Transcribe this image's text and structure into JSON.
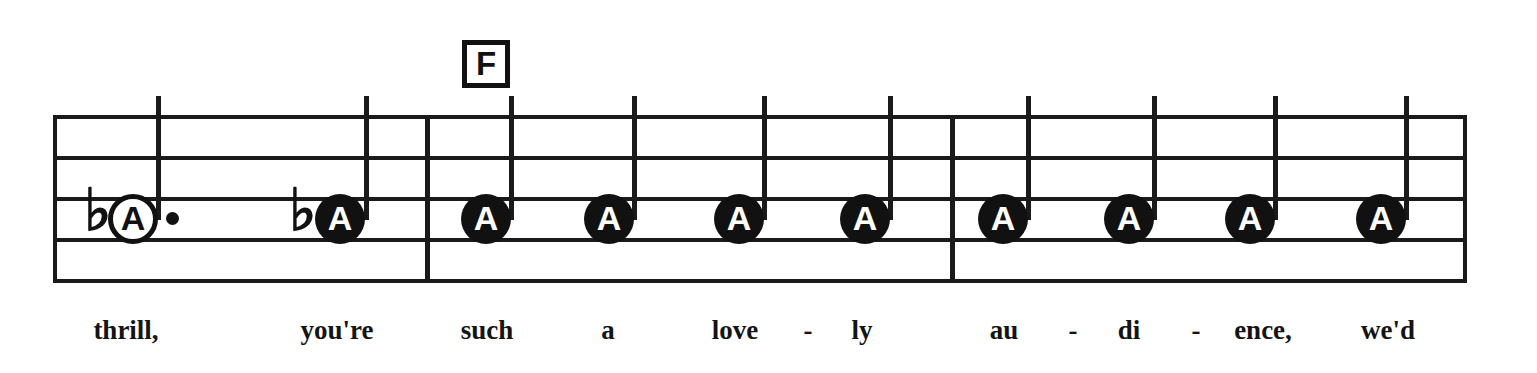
{
  "sheet": {
    "chord_symbol": "F",
    "chord_symbol_icon": "chord-box-icon",
    "staff_line_count": 5,
    "measure_count": 3,
    "colors": {
      "ink": "#111111",
      "paper": "#ffffff"
    },
    "notes": [
      {
        "letter": "A",
        "head": "hollow",
        "accidental": "♭",
        "dotted": true,
        "stem": "up",
        "measure": 1
      },
      {
        "letter": "A",
        "head": "filled",
        "accidental": "♭",
        "dotted": false,
        "stem": "up",
        "measure": 1
      },
      {
        "letter": "A",
        "head": "filled",
        "accidental": "",
        "dotted": false,
        "stem": "up",
        "measure": 2
      },
      {
        "letter": "A",
        "head": "filled",
        "accidental": "",
        "dotted": false,
        "stem": "up",
        "measure": 2
      },
      {
        "letter": "A",
        "head": "filled",
        "accidental": "",
        "dotted": false,
        "stem": "up",
        "measure": 2
      },
      {
        "letter": "A",
        "head": "filled",
        "accidental": "",
        "dotted": false,
        "stem": "up",
        "measure": 2
      },
      {
        "letter": "A",
        "head": "filled",
        "accidental": "",
        "dotted": false,
        "stem": "up",
        "measure": 3
      },
      {
        "letter": "A",
        "head": "filled",
        "accidental": "",
        "dotted": false,
        "stem": "up",
        "measure": 3
      },
      {
        "letter": "A",
        "head": "filled",
        "accidental": "",
        "dotted": false,
        "stem": "up",
        "measure": 3
      },
      {
        "letter": "A",
        "head": "filled",
        "accidental": "",
        "dotted": false,
        "stem": "up",
        "measure": 3
      }
    ],
    "lyrics": [
      {
        "text": "thrill,",
        "type": "word"
      },
      {
        "text": "you're",
        "type": "word"
      },
      {
        "text": "such",
        "type": "word"
      },
      {
        "text": "a",
        "type": "word"
      },
      {
        "text": "love",
        "type": "syllable"
      },
      {
        "text": "-",
        "type": "hyphen"
      },
      {
        "text": "ly",
        "type": "syllable"
      },
      {
        "text": "au",
        "type": "syllable"
      },
      {
        "text": "-",
        "type": "hyphen"
      },
      {
        "text": "di",
        "type": "syllable"
      },
      {
        "text": "-",
        "type": "hyphen"
      },
      {
        "text": "ence,",
        "type": "syllable"
      },
      {
        "text": "we'd",
        "type": "word"
      }
    ],
    "lyric_line_text": "thrill, you're such a love - ly au - di - ence, we'd"
  }
}
